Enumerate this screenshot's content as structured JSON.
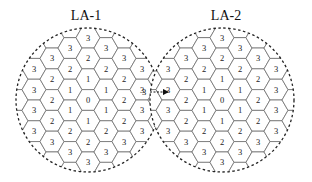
{
  "diagram": {
    "hex_size": 12,
    "colors": {
      "cell_stroke": "#6e6e6e",
      "boundary": "#222222",
      "text": "#222222"
    },
    "location_areas": [
      {
        "id": "la1",
        "title": "LA-1",
        "center": [
          88,
          100
        ],
        "radius": 72,
        "title_pos": [
          86,
          20
        ],
        "center_label": "0",
        "rings": [
          "0",
          "1",
          "2",
          "3"
        ]
      },
      {
        "id": "la2",
        "title": "LA-2",
        "center": [
          222,
          100
        ],
        "radius": 72,
        "title_pos": [
          226,
          20
        ],
        "center_label": "0",
        "rings": [
          "0",
          "1",
          "2",
          "3"
        ]
      }
    ],
    "movement": {
      "label": "3",
      "from": [
        140,
        92
      ],
      "to": [
        168,
        92
      ],
      "arrow": "right-arrow"
    }
  }
}
